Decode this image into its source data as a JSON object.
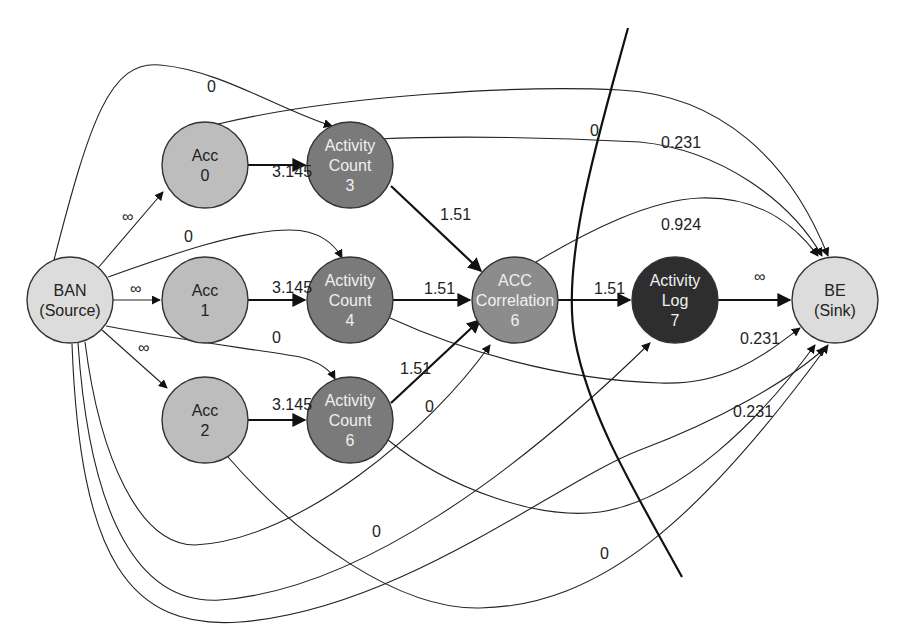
{
  "colors": {
    "source_sink": "#dcdcdc",
    "acc": "#bdbdbd",
    "activity_count": "#7a7a7a",
    "acc_correlation": "#8c8c8c",
    "activity_log": "#2e2e2e",
    "edge": "#222222",
    "text_dark": "#222222",
    "text_light": "#f0f0f0"
  },
  "nodes": [
    {
      "id": "ban",
      "line1": "BAN",
      "line2": "(Source)",
      "line3": "",
      "cx": 70,
      "cy": 300,
      "fill": "#dcdcdc",
      "text": "#222222"
    },
    {
      "id": "acc0",
      "line1": "Acc",
      "line2": "0",
      "line3": "",
      "cx": 205,
      "cy": 165,
      "fill": "#bdbdbd",
      "text": "#222222"
    },
    {
      "id": "acc1",
      "line1": "Acc",
      "line2": "1",
      "line3": "",
      "cx": 205,
      "cy": 300,
      "fill": "#bdbdbd",
      "text": "#222222"
    },
    {
      "id": "acc2",
      "line1": "Acc",
      "line2": "2",
      "line3": "",
      "cx": 205,
      "cy": 420,
      "fill": "#bdbdbd",
      "text": "#222222"
    },
    {
      "id": "ac3",
      "line1": "Activity",
      "line2": "Count",
      "line3": "3",
      "cx": 350,
      "cy": 165,
      "fill": "#7a7a7a",
      "text": "#f0f0f0"
    },
    {
      "id": "ac4",
      "line1": "Activity",
      "line2": "Count",
      "line3": "4",
      "cx": 350,
      "cy": 300,
      "fill": "#7a7a7a",
      "text": "#f0f0f0"
    },
    {
      "id": "ac6",
      "line1": "Activity",
      "line2": "Count",
      "line3": "6",
      "cx": 350,
      "cy": 420,
      "fill": "#7a7a7a",
      "text": "#f0f0f0"
    },
    {
      "id": "corr",
      "line1": "ACC",
      "line2": "Correlation",
      "line3": "6",
      "cx": 515,
      "cy": 300,
      "fill": "#8c8c8c",
      "text": "#f0f0f0"
    },
    {
      "id": "log",
      "line1": "Activity",
      "line2": "Log",
      "line3": "7",
      "cx": 675,
      "cy": 300,
      "fill": "#2e2e2e",
      "text": "#f0f0f0"
    },
    {
      "id": "be",
      "line1": "BE",
      "line2": "(Sink)",
      "line3": "",
      "cx": 835,
      "cy": 300,
      "fill": "#dcdcdc",
      "text": "#222222"
    }
  ],
  "edge_labels": [
    {
      "id": "ban-acc0",
      "text": "∞",
      "x": 122,
      "y": 222
    },
    {
      "id": "ban-acc1",
      "text": "∞",
      "x": 130,
      "y": 294
    },
    {
      "id": "ban-acc2",
      "text": "∞",
      "x": 138,
      "y": 353
    },
    {
      "id": "ban-ac3",
      "text": "0",
      "x": 207,
      "y": 92
    },
    {
      "id": "ban-ac4",
      "text": "0",
      "x": 184,
      "y": 242
    },
    {
      "id": "ban-ac6",
      "text": "0",
      "x": 272,
      "y": 343
    },
    {
      "id": "acc0-ac3",
      "text": "3.145",
      "x": 272,
      "y": 177
    },
    {
      "id": "acc1-ac4",
      "text": "3.145",
      "x": 272,
      "y": 293
    },
    {
      "id": "acc2-ac6",
      "text": "3.145",
      "x": 272,
      "y": 410
    },
    {
      "id": "ac3-corr",
      "text": "1.51",
      "x": 440,
      "y": 220
    },
    {
      "id": "ac4-corr",
      "text": "1.51",
      "x": 424,
      "y": 294
    },
    {
      "id": "ac6-corr",
      "text": "1.51",
      "x": 400,
      "y": 374
    },
    {
      "id": "ban-corr",
      "text": "0",
      "x": 425,
      "y": 412
    },
    {
      "id": "corr-log",
      "text": "1.51",
      "x": 594,
      "y": 294
    },
    {
      "id": "log-be",
      "text": "∞",
      "x": 754,
      "y": 282
    },
    {
      "id": "acc0-be",
      "text": "0",
      "x": 590,
      "y": 136
    },
    {
      "id": "ac3-be",
      "text": "0.231",
      "x": 661,
      "y": 148
    },
    {
      "id": "corr-be",
      "text": "0.924",
      "x": 661,
      "y": 230
    },
    {
      "id": "ac4-be",
      "text": "0.231",
      "x": 740,
      "y": 344
    },
    {
      "id": "ac6-be",
      "text": "0.231",
      "x": 733,
      "y": 417
    },
    {
      "id": "ban-log",
      "text": "0",
      "x": 372,
      "y": 537
    },
    {
      "id": "acc2-be",
      "text": "0",
      "x": 600,
      "y": 559
    }
  ]
}
